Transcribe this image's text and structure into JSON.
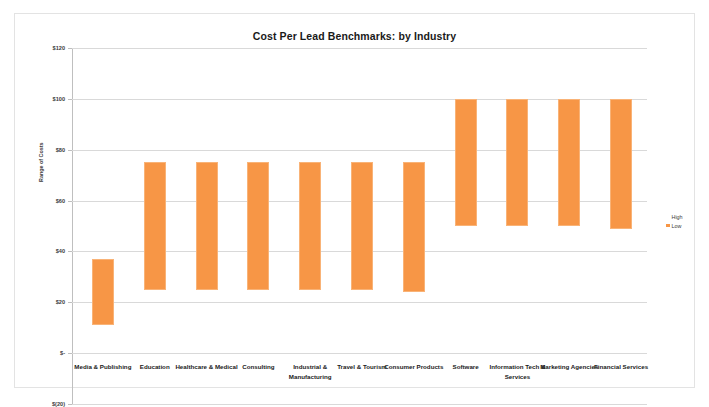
{
  "chart_data": {
    "type": "bar",
    "title": "Cost Per Lead Benchmarks: by Industry",
    "xlabel": "",
    "ylabel": "Range of Costs",
    "ylim": [
      -20,
      120
    ],
    "ytick_labels": [
      "$120",
      "$100",
      "$80",
      "$60",
      "$40",
      "$20",
      "$-",
      "$(20)"
    ],
    "ytick_values": [
      120,
      100,
      80,
      60,
      40,
      20,
      0,
      -20
    ],
    "grid": true,
    "legend_position": "right",
    "bar_color": "#f79646",
    "categories": [
      "Media & Publishing",
      "Education",
      "Healthcare & Medical",
      "Consulting",
      "Industrial & Manufacturing",
      "Travel & Tourism",
      "Consumer Products",
      "Software",
      "Information Tech & Services",
      "Marketing Agencies",
      "Financial Services"
    ],
    "series": [
      {
        "name": "High",
        "values": [
          37,
          75,
          75,
          75,
          75,
          75,
          75,
          100,
          100,
          100,
          100
        ]
      },
      {
        "name": "Low",
        "values": [
          11,
          25,
          25,
          25,
          25,
          25,
          24,
          50,
          50,
          50,
          49
        ]
      }
    ]
  },
  "legend": {
    "items": [
      {
        "label": "High",
        "swatch": "high"
      },
      {
        "label": "Low",
        "swatch": "low"
      }
    ]
  }
}
